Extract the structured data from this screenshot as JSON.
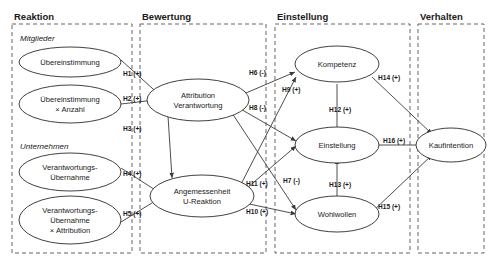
{
  "diagram": {
    "columns": [
      {
        "id": "reaktion",
        "label": "Reaktion"
      },
      {
        "id": "bewertung",
        "label": "Bewertung"
      },
      {
        "id": "einstellung",
        "label": "Einstellung"
      },
      {
        "id": "verhalten",
        "label": "Verhalten"
      }
    ],
    "group_labels": [
      {
        "id": "mitglieder",
        "label": "Mitglieder"
      },
      {
        "id": "unternehmen",
        "label": "Unternehmen"
      }
    ],
    "nodes": [
      {
        "id": "uebereinstimmung",
        "line1": "Übereinstimmung",
        "line2": "",
        "line3": ""
      },
      {
        "id": "uebereinstimmung-anzahl",
        "line1": "Übereinstimmung",
        "line2": "× Anzahl",
        "line3": ""
      },
      {
        "id": "verantwortung",
        "line1": "Verantwortungs-",
        "line2": "Übernahme",
        "line3": ""
      },
      {
        "id": "verantwortung-attr",
        "line1": "Verantwortungs-",
        "line2": "Übernahme",
        "line3": "× Attribution"
      },
      {
        "id": "attribution",
        "line1": "Attribution",
        "line2": "Verantwortung",
        "line3": ""
      },
      {
        "id": "angemessenheit",
        "line1": "Angemessenheit",
        "line2": "U-Reaktion",
        "line3": ""
      },
      {
        "id": "kompetenz",
        "line1": "Kompetenz",
        "line2": "",
        "line3": ""
      },
      {
        "id": "einstellung",
        "line1": "Einstellung",
        "line2": "",
        "line3": ""
      },
      {
        "id": "wohlwollen",
        "line1": "Wohlwollen",
        "line2": "",
        "line3": ""
      },
      {
        "id": "kaufintention",
        "line1": "Kaufintention",
        "line2": "",
        "line3": ""
      }
    ],
    "hypotheses": [
      {
        "id": "h1",
        "label": "H1 (+)",
        "sign": "+",
        "from": "uebereinstimmung",
        "to": "attribution"
      },
      {
        "id": "h2",
        "label": "H2 (+)",
        "sign": "+",
        "from": "uebereinstimmung-anzahl",
        "to": "attribution"
      },
      {
        "id": "h3",
        "label": "H3 (+)",
        "sign": "+",
        "from": "attribution",
        "to": "angemessenheit"
      },
      {
        "id": "h4",
        "label": "H4 (+)",
        "sign": "+",
        "from": "verantwortung",
        "to": "angemessenheit"
      },
      {
        "id": "h5",
        "label": "H5 (+)",
        "sign": "+",
        "from": "verantwortung-attr",
        "to": "angemessenheit"
      },
      {
        "id": "h6",
        "label": "H6 (-)",
        "sign": "-",
        "from": "attribution",
        "to": "kompetenz"
      },
      {
        "id": "h7",
        "label": "H7 (-)",
        "sign": "-",
        "from": "attribution",
        "to": "wohlwollen"
      },
      {
        "id": "h8",
        "label": "H8 (-)",
        "sign": "-",
        "from": "attribution",
        "to": "einstellung"
      },
      {
        "id": "h9",
        "label": "H9 (+)",
        "sign": "+",
        "from": "angemessenheit",
        "to": "kompetenz"
      },
      {
        "id": "h10",
        "label": "H10 (+)",
        "sign": "+",
        "from": "angemessenheit",
        "to": "wohlwollen"
      },
      {
        "id": "h11",
        "label": "H11 (+)",
        "sign": "+",
        "from": "angemessenheit",
        "to": "einstellung"
      },
      {
        "id": "h12",
        "label": "H12 (+)",
        "sign": "+",
        "from": "kompetenz",
        "to": "einstellung"
      },
      {
        "id": "h13",
        "label": "H13 (+)",
        "sign": "+",
        "from": "wohlwollen",
        "to": "einstellung"
      },
      {
        "id": "h14",
        "label": "H14 (+)",
        "sign": "+",
        "from": "kompetenz",
        "to": "kaufintention"
      },
      {
        "id": "h15",
        "label": "H15 (+)",
        "sign": "+",
        "from": "wohlwollen",
        "to": "kaufintention"
      },
      {
        "id": "h16",
        "label": "H16 (+)",
        "sign": "+",
        "from": "einstellung",
        "to": "kaufintention"
      }
    ],
    "colors": {
      "stroke": "#2b2b2b",
      "lane": "#555555",
      "text": "#1a1a1a",
      "background": "#ffffff"
    }
  }
}
